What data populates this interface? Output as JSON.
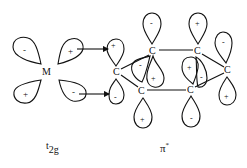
{
  "diagram": {
    "metal_label": "M",
    "carbon_label": "C",
    "left_caption": "t",
    "left_caption_sub": "2g",
    "right_caption": "π",
    "right_caption_sup": "*",
    "metal_lobes": [
      {
        "sign": "-",
        "cx": 26,
        "cy": 50,
        "dir": "up"
      },
      {
        "sign": "+",
        "cx": 72,
        "cy": 50,
        "dir": "up-right"
      },
      {
        "sign": "+",
        "cx": 26,
        "cy": 92,
        "dir": "down"
      },
      {
        "sign": "-",
        "cx": 73,
        "cy": 91,
        "dir": "down-right"
      }
    ],
    "carbons": [
      {
        "id": "c1",
        "x": 117,
        "y": 72
      },
      {
        "id": "c2",
        "x": 153,
        "y": 51
      },
      {
        "id": "c3",
        "x": 198,
        "y": 51
      },
      {
        "id": "c4",
        "x": 228,
        "y": 70
      },
      {
        "id": "c5",
        "x": 142,
        "y": 91
      },
      {
        "id": "c6",
        "x": 191,
        "y": 90
      }
    ],
    "ring_lobes": [
      {
        "sign": "+",
        "label_x": 114,
        "label_y": 48
      },
      {
        "sign": "-",
        "label_x": 116,
        "label_y": 99
      },
      {
        "sign": "-",
        "label_x": 151,
        "label_y": 24
      },
      {
        "sign": "+",
        "label_x": 198,
        "label_y": 24
      },
      {
        "sign": "-",
        "label_x": 223,
        "label_y": 43
      },
      {
        "sign": "+",
        "label_x": 227,
        "label_y": 97
      },
      {
        "sign": "+",
        "label_x": 143,
        "label_y": 121
      },
      {
        "sign": "-",
        "label_x": 192,
        "label_y": 119
      },
      {
        "sign": "-",
        "label_x": 141,
        "label_y": 67
      },
      {
        "sign": "+",
        "label_x": 154,
        "label_y": 79
      },
      {
        "sign": "+",
        "label_x": 190,
        "label_y": 68
      },
      {
        "sign": "-",
        "label_x": 201,
        "label_y": 79
      }
    ]
  }
}
